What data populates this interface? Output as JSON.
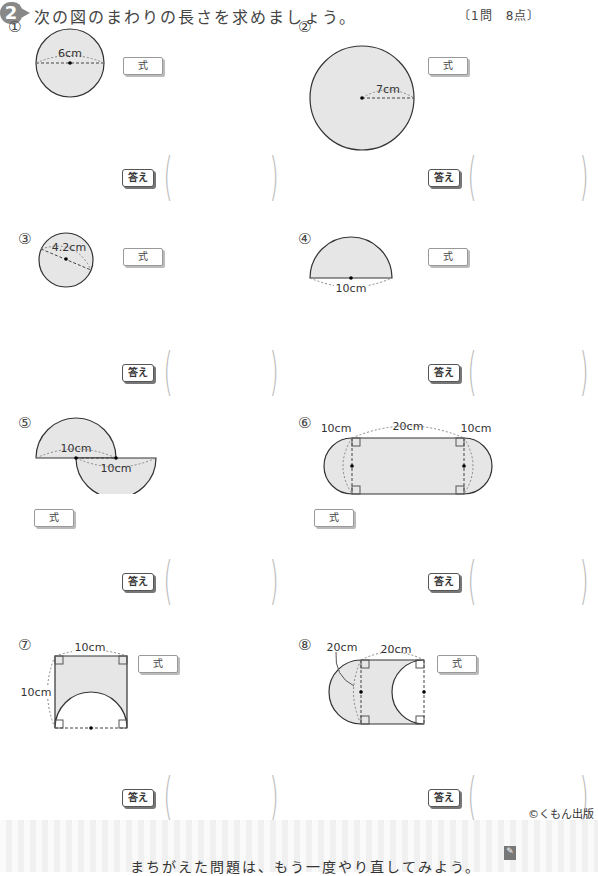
{
  "header": {
    "badge": "2",
    "instruction": "次の図のまわりの長さを求めましょう。",
    "points": "〔1問　8点〕"
  },
  "labels": {
    "formula": "式",
    "answer": "答え",
    "paren_open": "(",
    "paren_close": ")"
  },
  "questions": [
    {
      "num": "①",
      "dims": [
        "6cm"
      ]
    },
    {
      "num": "②",
      "dims": [
        "7cm"
      ]
    },
    {
      "num": "③",
      "dims": [
        "4.2cm"
      ]
    },
    {
      "num": "④",
      "dims": [
        "10cm"
      ]
    },
    {
      "num": "⑤",
      "dims": [
        "10cm",
        "10cm"
      ]
    },
    {
      "num": "⑥",
      "dims": [
        "10cm",
        "20cm",
        "10cm"
      ]
    },
    {
      "num": "⑦",
      "dims": [
        "10cm",
        "10cm"
      ]
    },
    {
      "num": "⑧",
      "dims": [
        "20cm",
        "20cm"
      ]
    }
  ],
  "footer": {
    "copyright": "©くもん出版",
    "message": "まちがえた問題は、もう一度やり直してみよう。"
  }
}
